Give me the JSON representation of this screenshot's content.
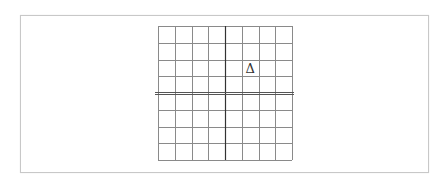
{
  "diagram": {
    "type": "coordinate-grid",
    "rows": 8,
    "cols": 8,
    "grid": {
      "left": 158,
      "top": 26,
      "width": 134,
      "height": 134
    },
    "vertical_axis_col": 4,
    "horizontal_axis_row": 4,
    "colors": {
      "grid": "#8a8a8a",
      "axis": "#333333",
      "frame": "#c8c8c8"
    },
    "marker": {
      "symbol": "Δ",
      "col": 5,
      "row": 2
    }
  }
}
